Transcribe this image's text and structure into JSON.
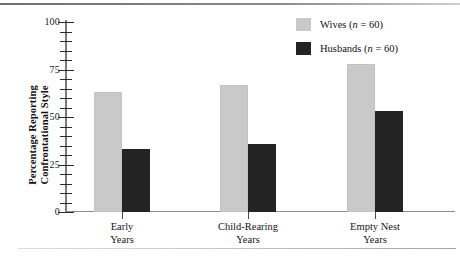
{
  "chart_data": {
    "type": "bar",
    "title": "",
    "xlabel": "",
    "ylabel": "Percentage Reporting Confrontational Style",
    "ylabel_line1": "Percentage Reporting",
    "ylabel_line2": "Confrontational Style",
    "categories": [
      "Early Years",
      "Child-Rearing Years",
      "Empty Nest Years"
    ],
    "category_lines": [
      [
        "Early",
        "Years"
      ],
      [
        "Child-Rearing",
        "Years"
      ],
      [
        "Empty Nest",
        "Years"
      ]
    ],
    "series": [
      {
        "name": "Wives (n = 60)",
        "label_main": "Wives",
        "label_n": "n",
        "label_tail": " = 60)",
        "color": "#c9c9c9",
        "values": [
          63,
          67,
          78
        ]
      },
      {
        "name": "Husbands (n = 60)",
        "label_main": "Husbands",
        "label_n": "n",
        "label_tail": " = 60)",
        "color": "#232323",
        "values": [
          33,
          36,
          53
        ]
      }
    ],
    "ylim": [
      0,
      100
    ],
    "ytick_labels": [
      "100",
      "75",
      "50",
      "25",
      "0"
    ],
    "ytick_values": [
      100,
      75,
      50,
      25,
      0
    ],
    "yminor_values": [
      95,
      90,
      85,
      80,
      70,
      65,
      60,
      55,
      45,
      40,
      35,
      30,
      20,
      15,
      10,
      5
    ],
    "grid": false,
    "legend_position": "top-right"
  }
}
